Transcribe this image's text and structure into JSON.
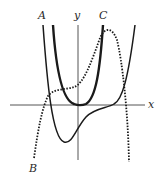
{
  "figure": {
    "axes": {
      "x_label": "x",
      "y_label": "y"
    },
    "curves": [
      {
        "label": "A",
        "style": "solid-thin",
        "description": "quartic-like curve with one local minimum left of y-axis and a flat inflection on positive x-axis"
      },
      {
        "label": "B",
        "style": "dotted",
        "description": "curve rising from lower left, plateau near x-axis, peak at upper right, falling steeply"
      },
      {
        "label": "C",
        "style": "solid-thick",
        "description": "U-shaped curve with flat minimum touching origin"
      }
    ],
    "colors": {
      "axis": "#555555",
      "curve": "#1a1a1a",
      "background": "#ffffff"
    }
  }
}
